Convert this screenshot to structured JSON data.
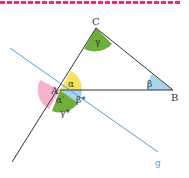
{
  "diagram": {
    "points": {
      "A": "A",
      "B": "B",
      "C": "C"
    },
    "angles": {
      "alpha": "α",
      "beta": "β",
      "gamma": "γ",
      "alpha_prime": "α′",
      "beta_star": "β*",
      "gamma_star": "γ*"
    },
    "line_label": "g",
    "colors": {
      "border": "#e8336b",
      "alpha": "#f5e35a",
      "beta": "#a9d4ee",
      "gamma": "#6fae3c",
      "alpha_prime": "#f3b3cf",
      "line_g": "#4a9fd6",
      "triangle": "#333333"
    }
  }
}
